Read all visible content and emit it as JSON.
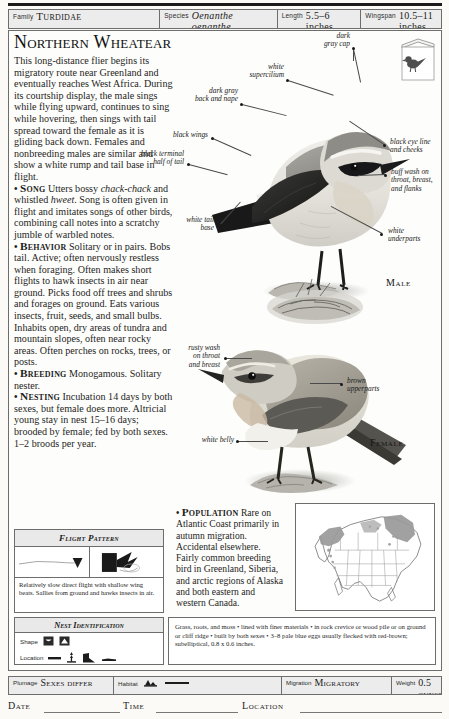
{
  "header": {
    "family_key": "Family",
    "family_value": "Turdidae",
    "species_key": "Species",
    "species_value": "Oenanthe oenanthe",
    "length_key": "Length",
    "length_value": "5.5–6 inches",
    "wingspan_key": "Wingspan",
    "wingspan_value": "10.5–11 inches"
  },
  "title": "Northern Wheatear",
  "intro": "This long-distance flier begins its migratory route near Greenland and eventually reaches West Africa. During its courtship display, the male sings while flying upward, continues to sing while hovering, then sings with tail spread toward the female as it is gliding back down. Females and nonbreeding males are similar and show a white rump and tail base in flight.",
  "sections": [
    {
      "label": "Song",
      "text_parts": [
        {
          "t": "Utters bossy ",
          "style": "normal"
        },
        {
          "t": "chack-chack",
          "style": "italic"
        },
        {
          "t": " and whistled ",
          "style": "normal"
        },
        {
          "t": "hweet",
          "style": "italic"
        },
        {
          "t": ". Song is often given in flight and imitates songs of other birds, combining call notes into a scratchy jumble of warbled notes.",
          "style": "normal"
        }
      ]
    },
    {
      "label": "Behavior",
      "text_parts": [
        {
          "t": "Solitary or in pairs. Bobs tail. Active; often nervously restless when foraging. Often makes short flights to hawk insects in air near ground. Picks food off trees and shrubs and forages on ground. Eats various insects, fruit, seeds, and small bulbs. Inhabits open, dry areas of tundra and mountain slopes, often near rocky areas. Often perches on rocks, trees, or posts.",
          "style": "normal"
        }
      ]
    },
    {
      "label": "Breeding",
      "text_parts": [
        {
          "t": "Monogamous. Solitary nester.",
          "style": "normal"
        }
      ]
    },
    {
      "label": "Nesting",
      "text_parts": [
        {
          "t": "Incubation 14 days by both sexes, but female does more. Altricial young stay in nest 15–16 days; brooded by female; fed by both sexes. 1–2 broods per year.",
          "style": "normal"
        }
      ]
    }
  ],
  "population": {
    "label": "Population",
    "text": "Rare on Atlantic Coast primarily in autumn migration. Accidental elsewhere. Fairly common breeding bird in Greenland, Siberia, and arctic regions of Alaska and both eastern and western Canada."
  },
  "plate": {
    "male_label": "Male",
    "female_label": "Female",
    "callouts": [
      {
        "id": "dark-gray-cap",
        "text": "dark\ngray cap"
      },
      {
        "id": "white-supercilium",
        "text": "white\nsupercilium"
      },
      {
        "id": "dark-gray-back-and-nape",
        "text": "dark gray\nback and nape"
      },
      {
        "id": "black-wings",
        "text": "black wings"
      },
      {
        "id": "black-terminal-half-of-tail",
        "text": "black terminal\nhalf of tail"
      },
      {
        "id": "white-tail-base",
        "text": "white tail\nbase"
      },
      {
        "id": "black-eye-line-and-cheeks",
        "text": "black eye line\nand cheeks"
      },
      {
        "id": "buff-wash-on-throat-breast-and-flanks",
        "text": "buff wash on\nthroat, breast,\nand flanks"
      },
      {
        "id": "white-underparts",
        "text": "white\nunderparts"
      },
      {
        "id": "rusty-wash-on-throat-and-breast",
        "text": "rusty wash\non throat\nand breast"
      },
      {
        "id": "brown-upperparts",
        "text": "brown\nupperparts"
      },
      {
        "id": "white-belly",
        "text": "white belly"
      }
    ]
  },
  "flight_pattern": {
    "caption": "Flight Pattern",
    "note": "Relatively slow direct flight with shallow wing beats. Sallies from ground and hawks insects in air."
  },
  "nest_identification": {
    "caption": "Nest Identification",
    "shape_key": "Shape",
    "location_key": "Location",
    "description": "Grass, roots, and moss • lined with finer materials • in rock crevice or wood pile or on ground or cliff ridge • built by both sexes • 3–8 pale blue eggs usually flecked with red-brown; subelliptical, 0.8 x 0.6 inches."
  },
  "attributes": {
    "plumage_key": "Plumage",
    "plumage_value": "Sexes differ",
    "habitat_key": "Habitat",
    "habitat_value": "",
    "migration_key": "Migration",
    "migration_value": "Migratory",
    "weight_key": "Weight",
    "weight_value": "0.5 ounce"
  },
  "footer": {
    "date_label": "Date",
    "time_label": "Time",
    "location_label": "Location"
  },
  "colors": {
    "rule": "#1b1b1b",
    "border": "#6d6d6d",
    "strip_bg": "#ececec",
    "range_fill": "#9a9a9a",
    "paper": "#fbfaf7"
  }
}
